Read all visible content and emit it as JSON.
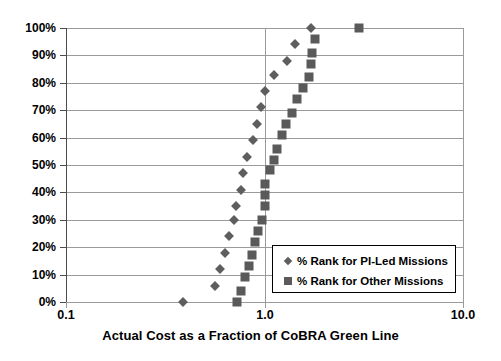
{
  "chart_data": {
    "type": "scatter",
    "title": "",
    "xlabel": "Actual Cost as a Fraction of CoBRA Green Line",
    "ylabel": "",
    "xscale": "log",
    "xlim": [
      0.1,
      10.0
    ],
    "ylim": [
      0,
      100
    ],
    "grid": "horizontal-and-vertical",
    "legend_position": "bottom-right",
    "x_tick_labels": [
      "0.1",
      "1.0",
      "10.0"
    ],
    "x_tick_values": [
      0.1,
      1.0,
      10.0
    ],
    "y_tick_labels": [
      "0%",
      "10%",
      "20%",
      "30%",
      "40%",
      "50%",
      "60%",
      "70%",
      "80%",
      "90%",
      "100%"
    ],
    "y_tick_values": [
      0,
      10,
      20,
      30,
      40,
      50,
      60,
      70,
      80,
      90,
      100
    ],
    "series": [
      {
        "name": "% Rank for PI-Led Missions",
        "marker": "diamond",
        "color": "#5e5e5e",
        "points": [
          {
            "x": 0.39,
            "y": 0
          },
          {
            "x": 0.56,
            "y": 6
          },
          {
            "x": 0.6,
            "y": 12
          },
          {
            "x": 0.63,
            "y": 18
          },
          {
            "x": 0.66,
            "y": 24
          },
          {
            "x": 0.7,
            "y": 30
          },
          {
            "x": 0.72,
            "y": 35
          },
          {
            "x": 0.76,
            "y": 41
          },
          {
            "x": 0.78,
            "y": 47
          },
          {
            "x": 0.82,
            "y": 53
          },
          {
            "x": 0.88,
            "y": 59
          },
          {
            "x": 0.92,
            "y": 65
          },
          {
            "x": 0.96,
            "y": 71
          },
          {
            "x": 1.0,
            "y": 77
          },
          {
            "x": 1.12,
            "y": 83
          },
          {
            "x": 1.3,
            "y": 88
          },
          {
            "x": 1.43,
            "y": 94
          },
          {
            "x": 1.72,
            "y": 100
          }
        ]
      },
      {
        "name": "% Rank for Other Missions",
        "marker": "square",
        "color": "#5a5a5a",
        "points": [
          {
            "x": 0.73,
            "y": 0
          },
          {
            "x": 0.76,
            "y": 4
          },
          {
            "x": 0.8,
            "y": 9
          },
          {
            "x": 0.84,
            "y": 13
          },
          {
            "x": 0.87,
            "y": 17
          },
          {
            "x": 0.9,
            "y": 22
          },
          {
            "x": 0.93,
            "y": 26
          },
          {
            "x": 0.97,
            "y": 30
          },
          {
            "x": 1.0,
            "y": 35
          },
          {
            "x": 1.0,
            "y": 39
          },
          {
            "x": 1.01,
            "y": 43
          },
          {
            "x": 1.06,
            "y": 48
          },
          {
            "x": 1.12,
            "y": 52
          },
          {
            "x": 1.16,
            "y": 56
          },
          {
            "x": 1.23,
            "y": 61
          },
          {
            "x": 1.29,
            "y": 65
          },
          {
            "x": 1.37,
            "y": 69
          },
          {
            "x": 1.46,
            "y": 74
          },
          {
            "x": 1.57,
            "y": 78
          },
          {
            "x": 1.67,
            "y": 82
          },
          {
            "x": 1.72,
            "y": 87
          },
          {
            "x": 1.74,
            "y": 91
          },
          {
            "x": 1.8,
            "y": 96
          },
          {
            "x": 3.0,
            "y": 100
          }
        ]
      }
    ]
  }
}
